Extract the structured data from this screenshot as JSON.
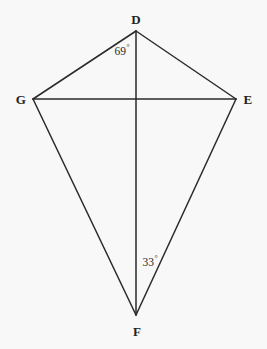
{
  "figure": {
    "kind": "geometry-diagram",
    "shape_name": "kite",
    "canvas": {
      "width": 267,
      "height": 349,
      "background": "#f8f8f8"
    },
    "style": {
      "stroke": "#2a2a2a",
      "stroke_width": 1.5,
      "label_color": "#232323"
    },
    "vertices": [
      {
        "id": "D",
        "label": "D",
        "x": 136,
        "y": 31,
        "label_x": 136,
        "label_y": 19
      },
      {
        "id": "G",
        "label": "G",
        "x": 33,
        "y": 99,
        "label_x": 21,
        "label_y": 99
      },
      {
        "id": "E",
        "label": "E",
        "x": 236,
        "y": 99,
        "label_x": 248,
        "label_y": 99
      },
      {
        "id": "F",
        "label": "F",
        "x": 136,
        "y": 315,
        "label_x": 137,
        "label_y": 331
      }
    ],
    "segments": [
      {
        "id": "DG",
        "from": "D",
        "to": "G",
        "x1": 136,
        "y1": 31,
        "x2": 33,
        "y2": 99
      },
      {
        "id": "DE",
        "from": "D",
        "to": "E",
        "x1": 136,
        "y1": 31,
        "x2": 236,
        "y2": 99
      },
      {
        "id": "GF",
        "from": "G",
        "to": "F",
        "x1": 33,
        "y1": 99,
        "x2": 136,
        "y2": 315
      },
      {
        "id": "EF",
        "from": "E",
        "to": "F",
        "x1": 236,
        "y1": 99,
        "x2": 136,
        "y2": 315
      },
      {
        "id": "GE",
        "from": "G",
        "to": "E",
        "x1": 33,
        "y1": 99,
        "x2": 236,
        "y2": 99
      },
      {
        "id": "DF",
        "from": "D",
        "to": "F",
        "x1": 136,
        "y1": 31,
        "x2": 136,
        "y2": 315
      }
    ],
    "intersection": {
      "id": "diagonal-intersection",
      "x": 136,
      "y": 99
    },
    "angle_labels": [
      {
        "id": "angle-GDF",
        "at_vertex": "D",
        "value": "69",
        "degree": "°",
        "x": 122,
        "y": 51
      },
      {
        "id": "angle-GFD",
        "at_vertex": "F",
        "value": "33",
        "degree": "°",
        "x": 150,
        "y": 262
      }
    ]
  }
}
